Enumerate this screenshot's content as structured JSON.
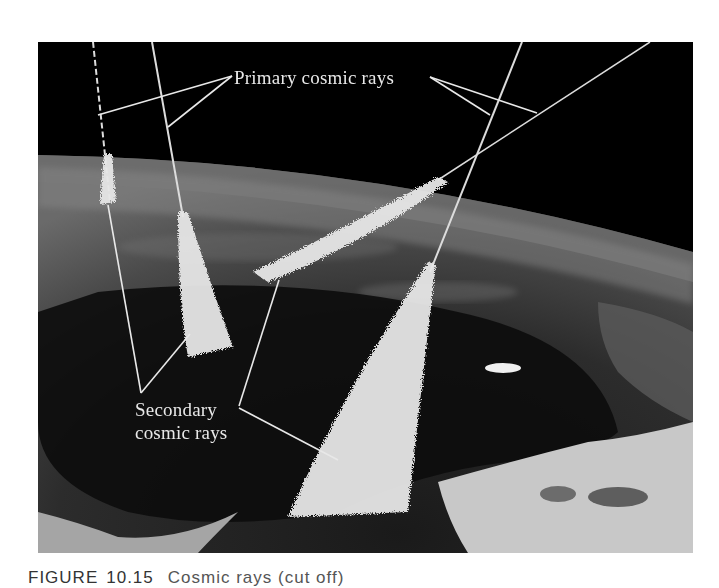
{
  "figure": {
    "labels": {
      "primary": "Primary cosmic rays",
      "secondary_line1": "Secondary",
      "secondary_line2": "cosmic rays"
    },
    "caption": {
      "prefix": "FIGURE",
      "number": "10.15",
      "text_visible": "Cosmic rays (cut off)"
    },
    "colors": {
      "space": "#000000",
      "label_text": "#e8e8e8",
      "ray_lines": "#dcdcdc",
      "page_background": "#ffffff"
    }
  }
}
